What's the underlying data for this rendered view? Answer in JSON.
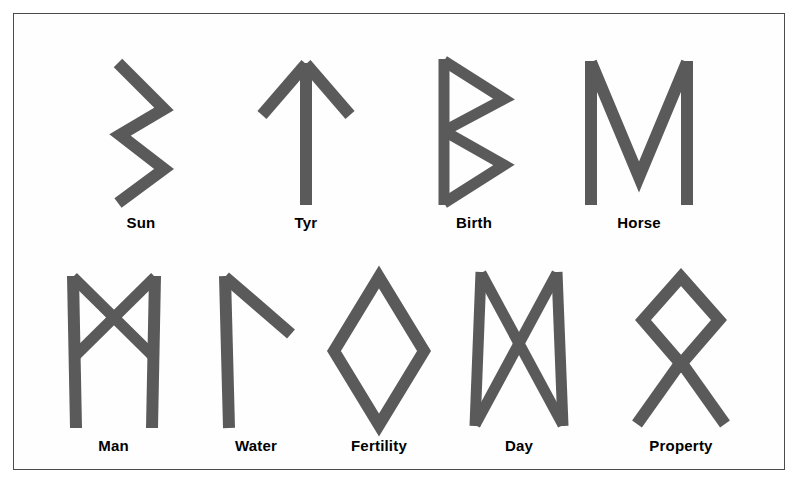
{
  "chart": {
    "background_color": "#ffffff",
    "frame_color": "#4c4c4c",
    "stroke_color": "#5a5a5a",
    "label_color": "#000000"
  },
  "rows": [
    {
      "row_index": 1,
      "runes": [
        {
          "name": "Sun",
          "label": "Sun",
          "rune_name": "sowilo",
          "unicode": "ᛋ",
          "shape": "zigzag",
          "x": 100,
          "y": 40,
          "width": 80,
          "height": 160
        },
        {
          "name": "Tyr",
          "label": "Tyr",
          "rune_name": "tiwaz",
          "unicode": "ᛏ",
          "shape": "up-arrow",
          "x": 255,
          "y": 40,
          "width": 100,
          "height": 160
        },
        {
          "name": "Birth",
          "label": "Birth",
          "rune_name": "berkano",
          "unicode": "ᛒ",
          "shape": "stave-two-bows",
          "x": 428,
          "y": 40,
          "width": 90,
          "height": 160
        },
        {
          "name": "Horse",
          "label": "Horse",
          "rune_name": "ehwaz",
          "unicode": "ᛖ",
          "shape": "m-shape",
          "x": 578,
          "y": 40,
          "width": 120,
          "height": 160
        }
      ]
    },
    {
      "row_index": 2,
      "runes": [
        {
          "name": "Man",
          "label": "Man",
          "rune_name": "mannaz",
          "unicode": "ᛗ",
          "shape": "two-staves-crossed",
          "x": 60,
          "y": 258,
          "width": 105,
          "height": 160
        },
        {
          "name": "Water",
          "label": "Water",
          "rune_name": "laguz",
          "unicode": "ᛚ",
          "shape": "stave-branch",
          "x": 210,
          "y": 258,
          "width": 90,
          "height": 160
        },
        {
          "name": "Fertility",
          "label": "Fertility",
          "rune_name": "ingwaz",
          "unicode": "ᛜ",
          "shape": "diamond",
          "x": 318,
          "y": 258,
          "width": 110,
          "height": 160
        },
        {
          "name": "Day",
          "label": "Day",
          "rune_name": "dagaz",
          "unicode": "ᛞ",
          "shape": "bowtie-staves",
          "x": 463,
          "y": 258,
          "width": 110,
          "height": 160
        },
        {
          "name": "Property",
          "label": "Property",
          "rune_name": "othala",
          "unicode": "ᛟ",
          "shape": "diamond-legs",
          "x": 620,
          "y": 258,
          "width": 115,
          "height": 160
        }
      ]
    }
  ],
  "labels": {
    "sun": "Sun",
    "tyr": "Tyr",
    "birth": "Birth",
    "horse": "Horse",
    "man": "Man",
    "water": "Water",
    "fertility": "Fertility",
    "day": "Day",
    "property": "Property"
  }
}
